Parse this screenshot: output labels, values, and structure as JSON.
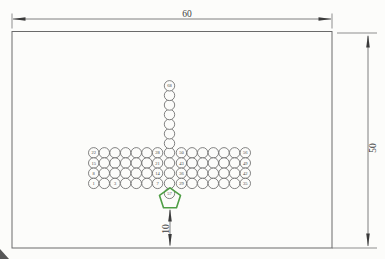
{
  "drawing": {
    "type": "tube-sheet-layout",
    "dimensions": {
      "top": "60",
      "right": "50",
      "bottom": "10"
    }
  },
  "colors": {
    "background": "#fcfcfa",
    "outline": "#6a6a6a",
    "dimension_lines": "#5f5f5f",
    "text": "#3c3c3c",
    "pentagon": "#4f9e45"
  },
  "tubes": {
    "bar_rows": 4,
    "cols_left": 7,
    "cols_right": 7,
    "stem_above_count": 7,
    "row_labels": [
      {
        "left_start": "22",
        "left_end": "28",
        "right_start": "50",
        "right_end": "56"
      },
      {
        "left_start": "15",
        "left_end": "21",
        "right_start": "43",
        "right_end": "49"
      },
      {
        "left_start": "8",
        "left_end": "14",
        "right_start": "36",
        "right_end": "42"
      },
      {
        "left_start": "1",
        "left_end": "7",
        "right_start": "29",
        "right_end": "35"
      }
    ],
    "extra_labels": [
      {
        "row": 3,
        "col": 2,
        "label": "3"
      }
    ],
    "stem_top_label": "68",
    "stem_bottom_label": "57"
  }
}
